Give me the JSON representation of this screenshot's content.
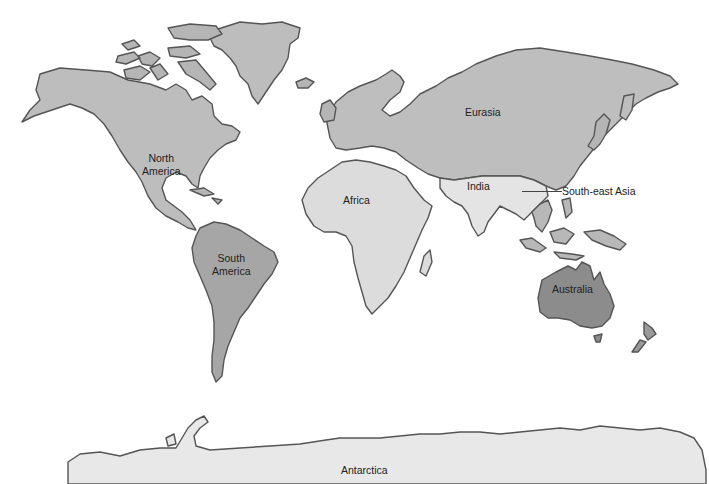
{
  "map": {
    "type": "world continents outline map",
    "colors": {
      "background": "#ffffff",
      "outline": "#555555",
      "north_america": "#bdbdbd",
      "south_america": "#a6a6a6",
      "eurasia": "#bebebe",
      "africa": "#dcdcdc",
      "india": "#e4e4e4",
      "south_east_asia": "#b8b8b8",
      "australia": "#8c8c8c",
      "antarctica": "#e8e8e8",
      "greenland": "#bdbdbd",
      "islands": "#b0b0b0"
    },
    "labels": {
      "north_america": [
        "North",
        "America"
      ],
      "south_america": [
        "South",
        "America"
      ],
      "eurasia": "Eurasia",
      "africa": "Africa",
      "india": "India",
      "south_east_asia": "South-east Asia",
      "australia": "Australia",
      "antarctica": "Antarctica"
    }
  }
}
